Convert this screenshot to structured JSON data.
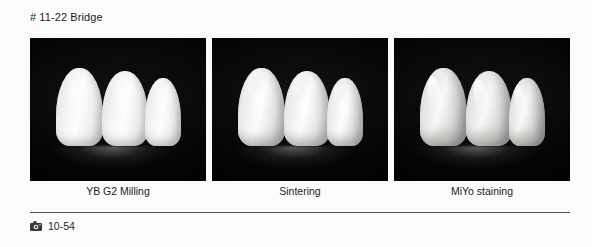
{
  "figure": {
    "title": "# 11-22 Bridge",
    "number": "10-54",
    "camera_icon": "camera-icon"
  },
  "panels": [
    {
      "caption": "YB G2 Milling",
      "subject": "three-unit-anterior-bridge",
      "finish": "milled-matte-zirconia",
      "background": "#050505"
    },
    {
      "caption": "Sintering",
      "subject": "three-unit-anterior-bridge",
      "finish": "sintered-semi-gloss",
      "background": "#050505"
    },
    {
      "caption": "MiYo staining",
      "subject": "three-unit-anterior-bridge",
      "finish": "glazed-stained-high-gloss",
      "background": "#050505"
    }
  ],
  "colors": {
    "page_background": "#fbfbfb",
    "photo_background": "#050505",
    "text": "#1b1b1b",
    "rule": "#4a4a4a"
  }
}
